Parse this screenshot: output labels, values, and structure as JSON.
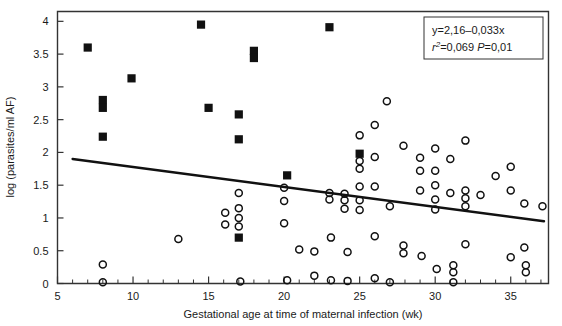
{
  "chart_data": {
    "type": "scatter",
    "title": "",
    "xlabel": "Gestational age at time of maternal infection (wk)",
    "ylabel": "log (parasites/ml AF)",
    "xlim": [
      5,
      37.5
    ],
    "ylim": [
      0,
      4.15
    ],
    "xticks": [
      5,
      10,
      15,
      20,
      25,
      30,
      35
    ],
    "xtick_labels": [
      "5",
      "10",
      "15",
      "20",
      "25",
      "30",
      "35"
    ],
    "xminor_step": 1,
    "yticks": [
      0,
      0.5,
      1,
      1.5,
      2,
      2.5,
      3,
      3.5,
      4
    ],
    "ytick_labels": [
      "0",
      "0.5",
      "1",
      "1.5",
      "2",
      "2.5",
      "3",
      "3.5",
      "4"
    ],
    "grid": false,
    "legend_position": "top-right",
    "annotations": {
      "equation": "y=2,16–0,033x",
      "stats_r2_label": "r",
      "stats_r2_sup": "2",
      "stats_r2_value": "=0,069",
      "stats_p_label": "P",
      "stats_p_value": "=0,01"
    },
    "fit_line": {
      "label": "regression line",
      "slope": -0.033,
      "intercept": 2.16,
      "x_start": 6.0,
      "y_start": 1.9,
      "x_end": 37.2,
      "y_end": 0.95
    },
    "series": [
      {
        "name": "filled-square",
        "marker": "square",
        "fill": "#111111",
        "points": [
          [
            7.0,
            3.6
          ],
          [
            8.0,
            2.8
          ],
          [
            8.0,
            2.68
          ],
          [
            8.0,
            2.24
          ],
          [
            9.9,
            3.13
          ],
          [
            14.5,
            3.95
          ],
          [
            15.0,
            2.68
          ],
          [
            17.0,
            2.58
          ],
          [
            17.0,
            2.2
          ],
          [
            17.0,
            0.7
          ],
          [
            18.0,
            3.55
          ],
          [
            18.0,
            3.44
          ],
          [
            20.2,
            1.65
          ],
          [
            23.0,
            3.91
          ],
          [
            25.0,
            1.98
          ]
        ]
      },
      {
        "name": "open-circle",
        "marker": "circle",
        "fill": "none",
        "points": [
          [
            8.0,
            0.29
          ],
          [
            8.0,
            0.02
          ],
          [
            13.0,
            0.68
          ],
          [
            16.1,
            1.08
          ],
          [
            16.1,
            0.9
          ],
          [
            17.0,
            1.38
          ],
          [
            17.0,
            1.15
          ],
          [
            17.0,
            1.0
          ],
          [
            17.0,
            0.87
          ],
          [
            17.1,
            0.03
          ],
          [
            20.0,
            1.46
          ],
          [
            20.0,
            1.26
          ],
          [
            20.0,
            0.92
          ],
          [
            20.2,
            0.05
          ],
          [
            21.0,
            0.52
          ],
          [
            22.0,
            0.49
          ],
          [
            22.0,
            0.12
          ],
          [
            23.0,
            1.38
          ],
          [
            23.0,
            1.28
          ],
          [
            23.1,
            0.7
          ],
          [
            23.1,
            0.05
          ],
          [
            24.0,
            1.37
          ],
          [
            24.0,
            1.27
          ],
          [
            24.0,
            1.14
          ],
          [
            24.2,
            0.48
          ],
          [
            24.2,
            0.04
          ],
          [
            25.0,
            2.26
          ],
          [
            25.0,
            1.87
          ],
          [
            25.0,
            1.75
          ],
          [
            25.0,
            1.48
          ],
          [
            25.0,
            1.27
          ],
          [
            25.0,
            1.12
          ],
          [
            26.0,
            2.42
          ],
          [
            26.0,
            1.93
          ],
          [
            26.0,
            1.48
          ],
          [
            26.0,
            0.72
          ],
          [
            26.0,
            0.08
          ],
          [
            26.8,
            2.78
          ],
          [
            27.0,
            1.18
          ],
          [
            27.0,
            0.02
          ],
          [
            27.9,
            2.1
          ],
          [
            27.9,
            0.58
          ],
          [
            27.9,
            0.46
          ],
          [
            29.0,
            1.92
          ],
          [
            29.0,
            1.72
          ],
          [
            29.0,
            1.42
          ],
          [
            29.1,
            0.42
          ],
          [
            30.0,
            2.06
          ],
          [
            30.0,
            1.72
          ],
          [
            30.0,
            1.5
          ],
          [
            30.0,
            1.28
          ],
          [
            30.0,
            1.13
          ],
          [
            30.1,
            0.22
          ],
          [
            31.0,
            1.9
          ],
          [
            31.0,
            1.38
          ],
          [
            31.2,
            0.28
          ],
          [
            31.2,
            0.17
          ],
          [
            31.2,
            0.02
          ],
          [
            32.0,
            2.18
          ],
          [
            32.0,
            1.42
          ],
          [
            32.0,
            1.3
          ],
          [
            32.0,
            1.18
          ],
          [
            32.0,
            0.6
          ],
          [
            33.0,
            1.35
          ],
          [
            34.0,
            1.64
          ],
          [
            35.0,
            1.78
          ],
          [
            35.0,
            1.42
          ],
          [
            35.0,
            0.4
          ],
          [
            35.9,
            1.22
          ],
          [
            35.9,
            0.55
          ],
          [
            36.0,
            0.28
          ],
          [
            36.0,
            0.17
          ],
          [
            37.1,
            1.18
          ]
        ]
      }
    ]
  },
  "axes": {
    "frame_color": "#333333"
  }
}
